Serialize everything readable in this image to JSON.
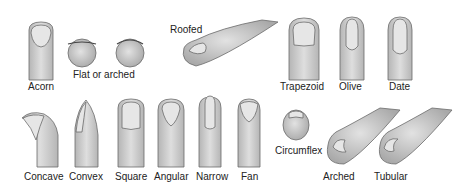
{
  "figure": {
    "colors": {
      "skin": "#d6d6d6",
      "skin_shade": "#b9b9b9",
      "nail": "#e6e6e6",
      "outline": "#6b6b6b",
      "text": "#222222"
    },
    "labels": {
      "acorn": "Acorn",
      "flat_or_arched": "Flat or arched",
      "roofed": "Roofed",
      "trapezoid": "Trapezoid",
      "olive": "Olive",
      "date": "Date",
      "concave": "Concave",
      "convex": "Convex",
      "square": "Square",
      "angular": "Angular",
      "narrow": "Narrow",
      "fan": "Fan",
      "circumflex": "Circumflex",
      "arched": "Arched",
      "tubular": "Tubular"
    }
  }
}
